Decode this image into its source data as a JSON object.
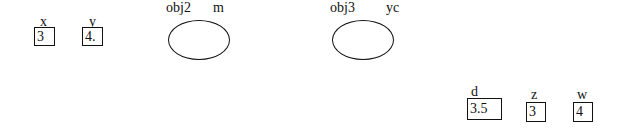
{
  "variables": [
    {
      "name": "x",
      "value": "3"
    },
    {
      "name": "y",
      "value": "4."
    },
    {
      "name": "d",
      "value": "3.5"
    },
    {
      "name": "z",
      "value": "3"
    },
    {
      "name": "w",
      "value": "4"
    }
  ],
  "objects": [
    {
      "name": "obj2",
      "ref": "m"
    },
    {
      "name": "obj3",
      "ref": "yc"
    }
  ],
  "colors": {
    "stroke": "#111111",
    "background": "#ffffff"
  }
}
